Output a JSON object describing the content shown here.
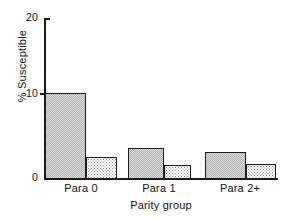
{
  "chart_data": {
    "type": "bar",
    "title": "",
    "xlabel": "Parity group",
    "ylabel": "% Susceptible",
    "categories": [
      "Para 0",
      "Para 1",
      "Para 2+"
    ],
    "ylim": [
      0,
      20
    ],
    "yticks": [
      0,
      10,
      20
    ],
    "ytick_labels": [
      "0",
      "10",
      "20"
    ],
    "grid": false,
    "legend": "none",
    "series": [
      {
        "name": "series-1",
        "fill": "dense-checker",
        "values": [
          10.7,
          3.8,
          3.3
        ]
      },
      {
        "name": "series-2",
        "fill": "sparse-dots",
        "values": [
          2.7,
          1.8,
          1.9
        ]
      }
    ],
    "colors": {
      "axis": "#1a1a1a",
      "bar_outline": "#1b1b1b",
      "bar_dark_fill": "#d9d9d9",
      "bar_light_fill": "#ffffff",
      "background": "#ffffff",
      "text": "#111111"
    }
  },
  "axis": {
    "y_tick_20": "20",
    "y_tick_10": "10",
    "y_tick_0": "0",
    "y_title": "% Susceptible",
    "x_title": "Parity group"
  },
  "categories": {
    "c0": "Para 0",
    "c1": "Para 1",
    "c2": "Para 2+"
  }
}
